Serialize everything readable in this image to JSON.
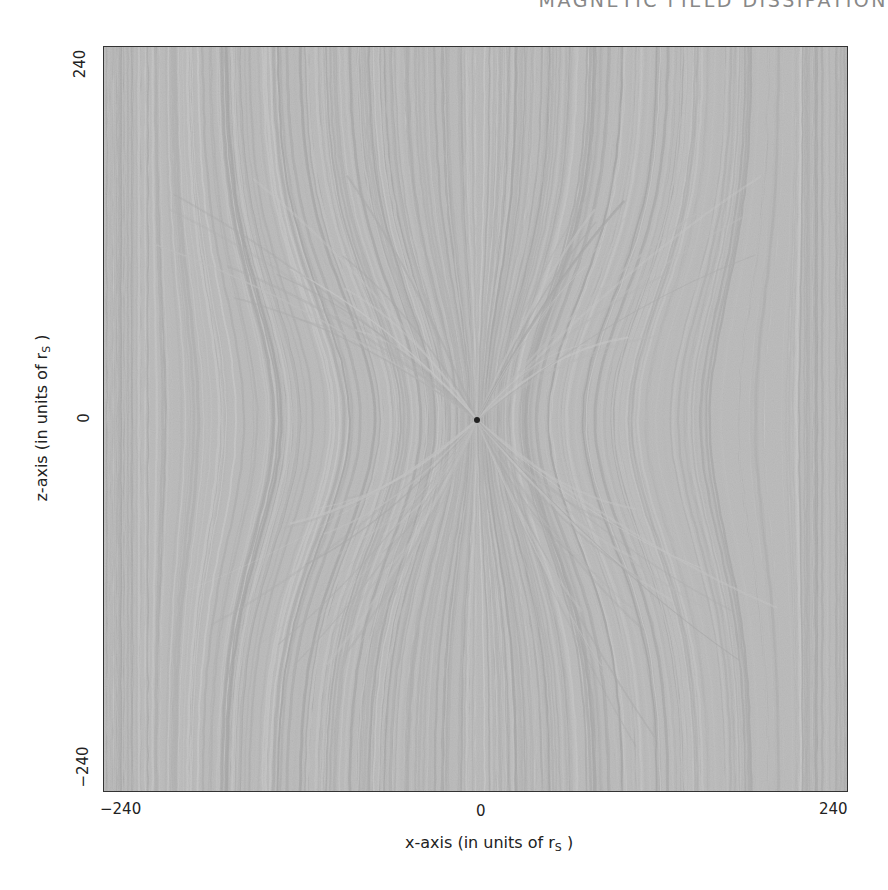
{
  "header": {
    "title": "MAGNETIC FIELD DISSIPATION"
  },
  "chart_data": {
    "type": "heatmap",
    "title": "MAGNETIC FIELD DISSIPATION",
    "xlabel": "x-axis (in units of r",
    "xlabel_sub": "S",
    "xlabel_close": ")",
    "ylabel": "z-axis (in units of r",
    "ylabel_sub": "S",
    "ylabel_close": ")",
    "xlim": [
      -240,
      240
    ],
    "ylim": [
      -240,
      240
    ],
    "xticks": [
      "-240",
      "0",
      "240"
    ],
    "yticks": [
      "-240",
      "0",
      "240"
    ],
    "xtick_labels": {
      "min": "−240",
      "mid": "0",
      "max": "240"
    },
    "ytick_labels": {
      "min": "−240",
      "mid": "0",
      "max": "240"
    },
    "center_marker": {
      "x": 0,
      "z": 0,
      "color": "#222222"
    },
    "colormap": "grayscale",
    "colors": {
      "background": "#bdbdbd",
      "light_streak": "#d2d2d2",
      "dark_streak": "#9c9c9c",
      "frame": "#333333"
    },
    "grid": false,
    "legend": null
  }
}
